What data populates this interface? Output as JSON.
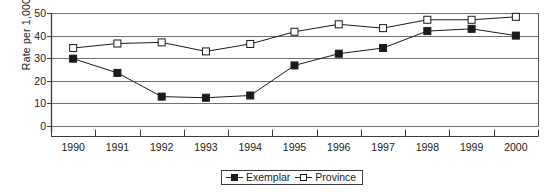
{
  "chart_data": {
    "type": "line",
    "title": "",
    "xlabel": "",
    "ylabel": "Rate per 1,000",
    "categories": [
      "1990",
      "1991",
      "1992",
      "1993",
      "1994",
      "1995",
      "1996",
      "1997",
      "1998",
      "1999",
      "2000"
    ],
    "ylim": [
      0,
      50
    ],
    "yticks": [
      0,
      10,
      20,
      30,
      40,
      50
    ],
    "ytick_labels": [
      "0",
      "10",
      "20",
      "30",
      "40",
      "50"
    ],
    "grid": "horizontal",
    "legend_position": "bottom-center",
    "series": [
      {
        "name": "Exemplar",
        "marker": "filled-square",
        "color": "#1a1a1a",
        "values": [
          29.8,
          23.5,
          13.0,
          12.5,
          13.5,
          26.8,
          32.0,
          34.5,
          42.0,
          43.0,
          40.0
        ]
      },
      {
        "name": "Province",
        "marker": "open-square",
        "color": "#1a1a1a",
        "values": [
          34.5,
          36.5,
          37.0,
          33.0,
          36.3,
          41.7,
          45.0,
          43.3,
          47.0,
          47.0,
          48.3
        ]
      }
    ]
  },
  "legend": {
    "items": [
      {
        "label": "Exemplar",
        "marker": "filled-square"
      },
      {
        "label": "Province",
        "marker": "open-square"
      }
    ]
  }
}
